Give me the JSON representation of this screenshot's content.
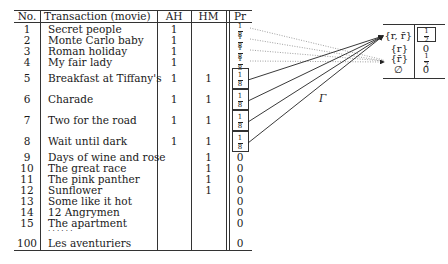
{
  "main_table": {
    "headers": {
      "no": "No.",
      "transaction": "Transaction (movie)",
      "ah": "AH",
      "hm": "HM",
      "pr": "Pr"
    },
    "rows": [
      {
        "no": "1",
        "title": "Secret people",
        "ah": "1",
        "hm": "",
        "pr": "1/8"
      },
      {
        "no": "2",
        "title": "Monte Carlo baby",
        "ah": "1",
        "hm": "",
        "pr": "1/8"
      },
      {
        "no": "3",
        "title": "Roman holiday",
        "ah": "1",
        "hm": "",
        "pr": "1/8"
      },
      {
        "no": "4",
        "title": "My fair lady",
        "ah": "1",
        "hm": "",
        "pr": "1/8"
      },
      {
        "no": "5",
        "title": "Breakfast at Tiffany's",
        "ah": "1",
        "hm": "1",
        "pr": "1/8"
      },
      {
        "no": "6",
        "title": "Charade",
        "ah": "1",
        "hm": "1",
        "pr": "1/8"
      },
      {
        "no": "7",
        "title": "Two for the road",
        "ah": "1",
        "hm": "1",
        "pr": "1/8"
      },
      {
        "no": "8",
        "title": "Wait until dark",
        "ah": "1",
        "hm": "1",
        "pr": "1/8"
      },
      {
        "no": "9",
        "title": "Days of wine and rose",
        "ah": "",
        "hm": "1",
        "pr": "0"
      },
      {
        "no": "10",
        "title": "The great race",
        "ah": "",
        "hm": "1",
        "pr": "0"
      },
      {
        "no": "11",
        "title": "The pink panther",
        "ah": "",
        "hm": "1",
        "pr": "0"
      },
      {
        "no": "12",
        "title": "Sunflower",
        "ah": "",
        "hm": "1",
        "pr": "0"
      },
      {
        "no": "13",
        "title": "Some like it hot",
        "ah": "",
        "hm": "",
        "pr": "0"
      },
      {
        "no": "14",
        "title": "12 Angrymen",
        "ah": "",
        "hm": "",
        "pr": "0"
      },
      {
        "no": "15",
        "title": "The apartment",
        "ah": "",
        "hm": "",
        "pr": "0"
      },
      {
        "no": "",
        "title": "· · · · · ·",
        "ah": "",
        "hm": "",
        "pr": ""
      },
      {
        "no": "100",
        "title": "Les aventuriers",
        "ah": "",
        "hm": "",
        "pr": "0"
      }
    ],
    "frac_num": "1",
    "frac_den": "8"
  },
  "side_table": {
    "rows": [
      {
        "set": "{r, r̄}",
        "value_num": "1",
        "value_den": "2",
        "boxed": true
      },
      {
        "set": "{r}",
        "value": "0"
      },
      {
        "set": "{r̄}",
        "value_num": "1",
        "value_den": "2"
      },
      {
        "set": "∅",
        "value": "0"
      }
    ]
  },
  "mapping_label": "Γ"
}
